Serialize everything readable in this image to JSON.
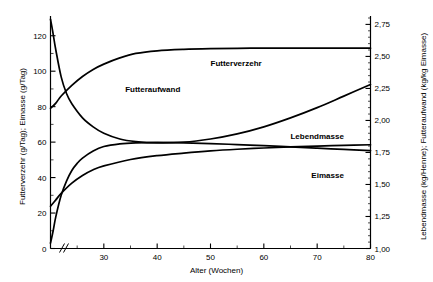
{
  "chart_data": {
    "type": "line",
    "title": "",
    "xlabel": "Alter (Wochen)",
    "ylabel_left": "Futterverzehr (g/Tag); Eimasse (g/Tag)",
    "ylabel_right": "Lebendmasse (kg/Henne); Futteraufwand (kg/kg Eimasse)",
    "xlim": [
      20,
      80
    ],
    "ylim_left": [
      0,
      130
    ],
    "ylim_right": [
      1.0,
      2.8
    ],
    "x_ticks_major": [
      30,
      40,
      50,
      60,
      70,
      80
    ],
    "x_ticks_major_labels": [
      "30",
      "40",
      "50",
      "60",
      "70",
      "80"
    ],
    "x_ticks_minor": [
      25,
      35,
      45,
      55,
      65,
      75
    ],
    "y_ticks_left_major": [
      0,
      20,
      40,
      60,
      80,
      100,
      120
    ],
    "y_ticks_left_labels": [
      "0",
      "20",
      "40",
      "60",
      "80",
      "100",
      "120"
    ],
    "y_ticks_left_minor": [
      10,
      30,
      50,
      70,
      90,
      110
    ],
    "y_ticks_right_major": [
      1.0,
      1.25,
      1.5,
      1.75,
      2.0,
      2.25,
      2.5,
      2.75
    ],
    "y_ticks_right_labels": [
      "1,00",
      "1,25",
      "1,50",
      "1,75",
      "2,00",
      "2,25",
      "2,50",
      "2,75"
    ],
    "grid": false,
    "legend_position": "inline-labels",
    "axis_break_x": true,
    "axis_break_note": "//",
    "series": [
      {
        "name": "Futterverzehr",
        "axis": "left",
        "unit": "g/Tag",
        "label_x": 50,
        "label_y": 103,
        "x": [
          20,
          21,
          22,
          24,
          26,
          28,
          30,
          33,
          36,
          40,
          45,
          50,
          55,
          60,
          65,
          70,
          75,
          80
        ],
        "values": [
          79,
          82,
          86,
          92,
          97,
          101,
          104,
          107.5,
          110,
          111.5,
          112.3,
          112.7,
          112.9,
          113,
          113,
          113,
          113,
          113
        ]
      },
      {
        "name": "Futteraufwand",
        "axis": "right",
        "unit": "kg/kg Eimasse",
        "label_x": 34,
        "label_y": 88,
        "x": [
          20,
          20.4,
          21,
          22,
          23,
          24,
          26,
          28,
          30,
          33,
          36,
          40,
          45,
          50,
          55,
          60,
          65,
          70,
          75,
          80
        ],
        "values": [
          2.79,
          2.7,
          2.55,
          2.34,
          2.21,
          2.13,
          2.02,
          1.95,
          1.9,
          1.855,
          1.835,
          1.825,
          1.83,
          1.855,
          1.895,
          1.95,
          2.02,
          2.1,
          2.19,
          2.28
        ]
      },
      {
        "name": "Lebendmasse",
        "axis": "right",
        "unit": "kg/Henne",
        "label_x": 75,
        "label_y": 62,
        "x": [
          20,
          21,
          22,
          24,
          26,
          28,
          30,
          35,
          40,
          45,
          50,
          55,
          60,
          65,
          70,
          75,
          80
        ],
        "values": [
          1.33,
          1.38,
          1.43,
          1.51,
          1.57,
          1.615,
          1.645,
          1.695,
          1.725,
          1.745,
          1.762,
          1.775,
          1.785,
          1.793,
          1.8,
          1.806,
          1.81
        ]
      },
      {
        "name": "Eimasse",
        "axis": "left",
        "unit": "g/Tag",
        "label_x": 75,
        "label_y": 40,
        "x": [
          20,
          20.5,
          21,
          22,
          23,
          24,
          25,
          26,
          28,
          30,
          33,
          36,
          40,
          45,
          50,
          55,
          60,
          65,
          70,
          75,
          80
        ],
        "values": [
          3,
          10,
          18,
          30,
          38,
          44,
          48,
          51,
          55,
          57.5,
          59,
          59.6,
          59.8,
          59.6,
          59.2,
          58.6,
          58.0,
          57.3,
          56.6,
          55.9,
          55.2
        ]
      }
    ]
  }
}
